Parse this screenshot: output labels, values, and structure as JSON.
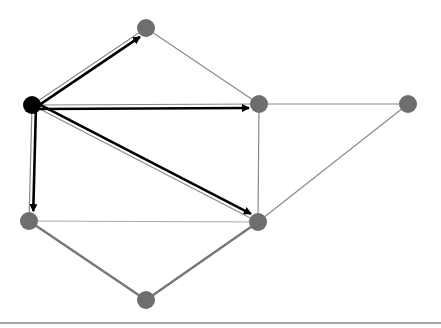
{
  "diagram": {
    "type": "graph-traversal",
    "width": 441,
    "height": 328,
    "colors": {
      "background": "#ffffff",
      "node_default": "#6e6e6e",
      "node_source": "#000000",
      "edge_default": "#8a8a8a",
      "edge_light": "#a8a8a8",
      "edge_highlight": "#777777",
      "arrow": "#000000",
      "baseline": "#8a8a8a"
    },
    "nodes": [
      {
        "id": "A",
        "x": 32,
        "y": 105,
        "role": "source"
      },
      {
        "id": "B",
        "x": 146,
        "y": 28,
        "role": "node"
      },
      {
        "id": "C",
        "x": 259,
        "y": 104,
        "role": "node"
      },
      {
        "id": "D",
        "x": 408,
        "y": 104,
        "role": "node"
      },
      {
        "id": "E",
        "x": 29,
        "y": 221,
        "role": "node"
      },
      {
        "id": "F",
        "x": 258,
        "y": 222,
        "role": "node"
      },
      {
        "id": "G",
        "x": 146,
        "y": 300,
        "role": "node"
      }
    ],
    "edges": [
      {
        "from": "A",
        "to": "B",
        "style": "thin"
      },
      {
        "from": "A",
        "to": "C",
        "style": "thin"
      },
      {
        "from": "A",
        "to": "E",
        "style": "thin"
      },
      {
        "from": "A",
        "to": "F",
        "style": "thin"
      },
      {
        "from": "B",
        "to": "C",
        "style": "thin"
      },
      {
        "from": "C",
        "to": "D",
        "style": "thin"
      },
      {
        "from": "C",
        "to": "F",
        "style": "thin"
      },
      {
        "from": "D",
        "to": "F",
        "style": "thin"
      },
      {
        "from": "E",
        "to": "F",
        "style": "light"
      },
      {
        "from": "E",
        "to": "G",
        "style": "thick"
      },
      {
        "from": "G",
        "to": "F",
        "style": "thick"
      }
    ],
    "arrows": [
      {
        "from": "A",
        "to": "B",
        "offset": -4
      },
      {
        "from": "A",
        "to": "C",
        "offset": -4
      },
      {
        "from": "A",
        "to": "E",
        "offset": 4
      },
      {
        "from": "A",
        "to": "F",
        "offset": 4
      }
    ],
    "baseline": {
      "y": 323
    }
  }
}
